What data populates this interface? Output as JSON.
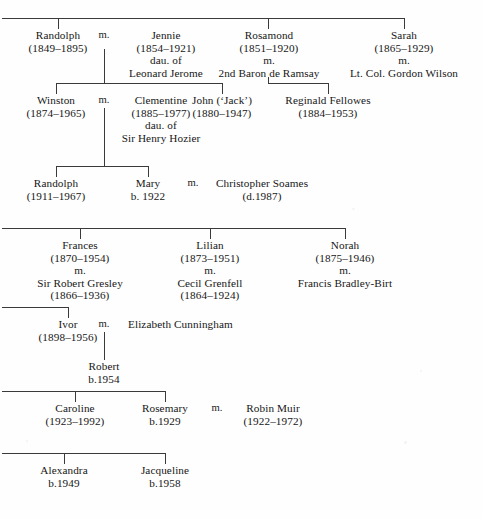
{
  "document": {
    "title": "Churchill and Fellowes family tree",
    "type": "genealogy-chart",
    "ink_color": "#161616",
    "rule_color": "#3a3a3a",
    "background_color": "#fefefe"
  },
  "marriage_symbol": "m.",
  "generation_1": {
    "siblings": [
      {
        "id": "randolph-1849",
        "name": "Randolph",
        "dates": "(1849–1895)"
      },
      {
        "id": "jennie",
        "name": "Jennie",
        "dates": "(1854–1921)",
        "note_1": "dau. of",
        "note_2": "Leonard Jerome"
      },
      {
        "id": "rosamond",
        "name": "Rosamond",
        "dates": "(1851–1920)",
        "marriage_mark": "m.",
        "spouse": "2nd Baron de Ramsay"
      },
      {
        "id": "sarah",
        "name": "Sarah",
        "dates": "(1865–1929)",
        "marriage_mark": "m.",
        "spouse": "Lt. Col. Gordon Wilson"
      }
    ]
  },
  "generation_2": {
    "people": [
      {
        "id": "winston",
        "name": "Winston",
        "dates": "(1874–1965)"
      },
      {
        "id": "clementine",
        "name": "Clementine",
        "dates": "(1885–1977)",
        "note_1": "dau. of",
        "note_2": "Sir Henry Hozier"
      },
      {
        "id": "john-jack",
        "name": "John (‘Jack’)",
        "dates": "(1880–1947)"
      },
      {
        "id": "reginald-fellowes",
        "name": "Reginald Fellowes",
        "dates": "(1884–1953)"
      }
    ]
  },
  "generation_3": {
    "people": [
      {
        "id": "randolph-1911",
        "name": "Randolph",
        "dates": "(1911–1967)"
      },
      {
        "id": "mary",
        "name": "Mary",
        "dates": "b. 1922"
      },
      {
        "id": "christopher-soames",
        "name": "Christopher Soames",
        "dates": "(d.1987)"
      }
    ]
  },
  "branch_2": {
    "siblings": [
      {
        "id": "frances",
        "name": "Frances",
        "dates": "(1870–1954)",
        "marriage_mark": "m.",
        "spouse": "Sir Robert Gresley",
        "spouse_dates": "(1866–1936)"
      },
      {
        "id": "lilian",
        "name": "Lilian",
        "dates": "(1873–1951)",
        "marriage_mark": "m.",
        "spouse": "Cecil Grenfell",
        "spouse_dates": "(1864–1924)"
      },
      {
        "id": "norah",
        "name": "Norah",
        "dates": "(1875–1946)",
        "marriage_mark": "m.",
        "spouse": "Francis Bradley-Birt"
      }
    ]
  },
  "branch_3": {
    "people": [
      {
        "id": "ivor",
        "name": "Ivor",
        "dates": "(1898–1956)"
      },
      {
        "id": "elizabeth-cunningham",
        "name": "Elizabeth Cunningham"
      },
      {
        "id": "robert",
        "name": "Robert",
        "dates": "b.1954"
      }
    ]
  },
  "branch_4": {
    "people": [
      {
        "id": "caroline",
        "name": "Caroline",
        "dates": "(1923–1992)"
      },
      {
        "id": "rosemary",
        "name": "Rosemary",
        "dates": "b.1929"
      },
      {
        "id": "robin-muir",
        "name": "Robin Muir",
        "dates": "(1922–1972)"
      }
    ]
  },
  "branch_5": {
    "people": [
      {
        "id": "alexandra",
        "name": "Alexandra",
        "dates": "b.1949"
      },
      {
        "id": "jacqueline",
        "name": "Jacqueline",
        "dates": "b.1958"
      }
    ]
  }
}
